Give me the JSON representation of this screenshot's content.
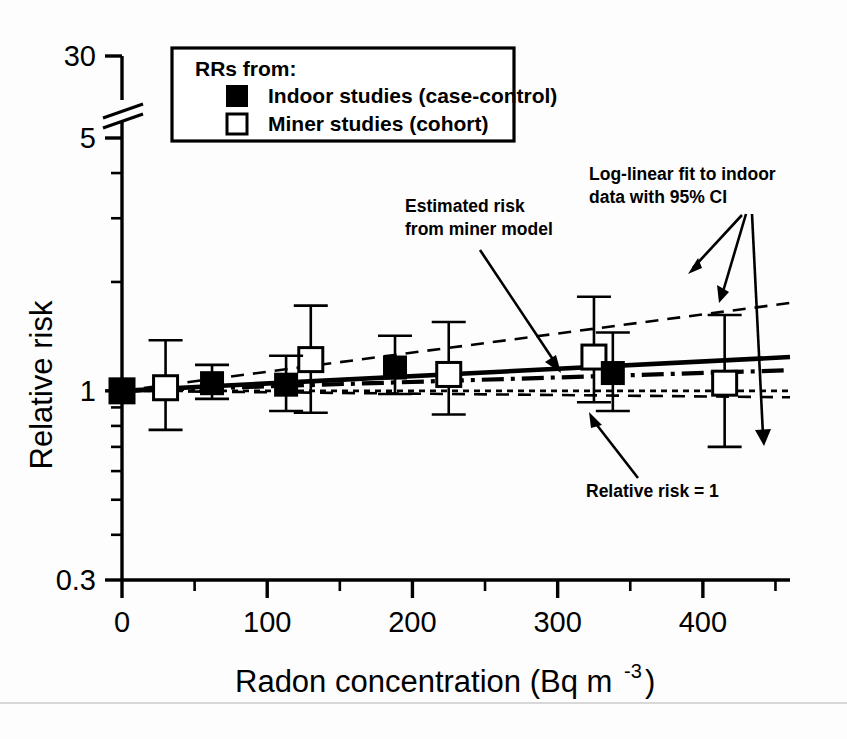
{
  "chart_data": {
    "type": "scatter",
    "title": "",
    "xlabel": "Radon concentration (Bq m",
    "xlabel_sup": "-3",
    "xlabel_tail": ")",
    "ylabel": "Relative risk",
    "xlim": [
      0,
      460
    ],
    "ylim": [
      0.3,
      30
    ],
    "yscale": "log",
    "y_axis_break": true,
    "y_break_between": [
      5,
      30
    ],
    "grid": false,
    "xticks": [
      0,
      100,
      200,
      300,
      400
    ],
    "xtick_labels": [
      "0",
      "100",
      "200",
      "300",
      "400"
    ],
    "xticks_minor": [
      50,
      150,
      250,
      350,
      450
    ],
    "yticks": [
      0.3,
      1,
      5,
      30
    ],
    "ytick_labels": [
      "0.3",
      "1",
      "5",
      "30"
    ],
    "yticks_minor": [
      0.4,
      0.5,
      0.6,
      0.7,
      0.8,
      0.9,
      2,
      3,
      4,
      10,
      20
    ],
    "series": [
      {
        "name": "Indoor studies (case-control)",
        "marker": "filled-square",
        "points": [
          {
            "x": 0,
            "y": 1.0,
            "ylo": 1.0,
            "yhi": 1.0
          },
          {
            "x": 62,
            "y": 1.05,
            "ylo": 0.95,
            "yhi": 1.18
          },
          {
            "x": 113,
            "y": 1.04,
            "ylo": 0.88,
            "yhi": 1.25
          },
          {
            "x": 188,
            "y": 1.16,
            "ylo": 0.98,
            "yhi": 1.42
          },
          {
            "x": 338,
            "y": 1.12,
            "ylo": 0.88,
            "yhi": 1.45
          }
        ]
      },
      {
        "name": "Miner studies (cohort)",
        "marker": "open-square",
        "points": [
          {
            "x": 0,
            "y": 1.0,
            "ylo": 1.0,
            "yhi": 1.0
          },
          {
            "x": 30,
            "y": 1.02,
            "ylo": 0.78,
            "yhi": 1.38
          },
          {
            "x": 130,
            "y": 1.22,
            "ylo": 0.87,
            "yhi": 1.72
          },
          {
            "x": 225,
            "y": 1.11,
            "ylo": 0.86,
            "yhi": 1.55
          },
          {
            "x": 325,
            "y": 1.24,
            "ylo": 0.93,
            "yhi": 1.82
          },
          {
            "x": 415,
            "y": 1.05,
            "ylo": 0.7,
            "yhi": 1.62
          }
        ]
      }
    ],
    "fits": [
      {
        "name": "Log-linear fit to indoor data",
        "style": "solid",
        "x": [
          0,
          460
        ],
        "y": [
          1.0,
          1.24
        ]
      },
      {
        "name": "Upper 95% CI",
        "style": "dashed",
        "x": [
          0,
          460
        ],
        "y": [
          1.0,
          1.75
        ]
      },
      {
        "name": "Lower 95% CI",
        "style": "dashed",
        "x": [
          0,
          460
        ],
        "y": [
          1.0,
          0.96
        ]
      },
      {
        "name": "Estimated risk from miner model",
        "style": "dash-dot",
        "x": [
          0,
          460
        ],
        "y": [
          1.0,
          1.14
        ]
      },
      {
        "name": "Relative risk = 1",
        "style": "dotted-ref",
        "x": [
          0,
          460
        ],
        "y": [
          1.0,
          1.0
        ]
      }
    ]
  },
  "legend": {
    "title": "RRs from:",
    "items": [
      {
        "marker": "filled-square",
        "label": "Indoor studies (case-control)"
      },
      {
        "marker": "open-square",
        "label": "Miner studies (cohort)"
      }
    ]
  },
  "annotations": [
    {
      "id": "loglinear-fit",
      "lines": [
        "Log-linear fit to indoor",
        "data with 95% CI"
      ]
    },
    {
      "id": "miner-model",
      "lines": [
        "Estimated risk",
        "from miner model"
      ]
    },
    {
      "id": "relative-risk-one",
      "lines": [
        "Relative risk = 1"
      ]
    }
  ],
  "axes": {
    "y_title": "Relative risk",
    "x_title_main": "Radon concentration (Bq m",
    "x_title_sup": "-3",
    "x_title_end": ")"
  },
  "colors": {
    "foreground": "#000000",
    "background": "#ffffff"
  }
}
